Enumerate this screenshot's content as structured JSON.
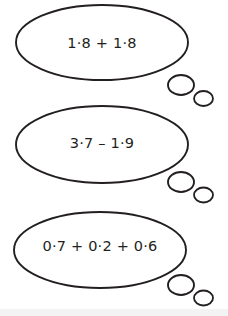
{
  "page": {
    "background_color": "#ffffff",
    "ink_color": "#231f20",
    "bottom_band_color": "#f3f3f4"
  },
  "bubbles": [
    {
      "id": "bubble-1",
      "expression": "1·8 + 1·8",
      "operation": "addition",
      "operands": [
        "1.8",
        "1.8"
      ],
      "ellipse": {
        "cx": 102,
        "cy": 42.5,
        "rx": 86,
        "ry": 37.5
      },
      "tails": [
        {
          "cx": 181,
          "cy": 85,
          "rx": 13,
          "ry": 10
        },
        {
          "cx": 203.5,
          "cy": 98.5,
          "rx": 9.5,
          "ry": 7.5
        }
      ],
      "text_position": {
        "x": 102,
        "y": 43
      }
    },
    {
      "id": "bubble-2",
      "expression": "3·7 – 1·9",
      "operation": "subtraction",
      "operands": [
        "3.7",
        "1.9"
      ],
      "ellipse": {
        "cx": 102,
        "cy": 144.5,
        "rx": 86,
        "ry": 38.5
      },
      "tails": [
        {
          "cx": 181,
          "cy": 182,
          "rx": 13,
          "ry": 10
        },
        {
          "cx": 203.5,
          "cy": 195,
          "rx": 9.5,
          "ry": 7.5
        }
      ],
      "text_position": {
        "x": 102,
        "y": 143
      }
    },
    {
      "id": "bubble-3",
      "expression": "0·7 + 0·2 + 0·6",
      "operation": "addition",
      "operands": [
        "0.7",
        "0.2",
        "0.6"
      ],
      "ellipse": {
        "cx": 100,
        "cy": 250,
        "rx": 86,
        "ry": 38
      },
      "tails": [
        {
          "cx": 181,
          "cy": 285,
          "rx": 13,
          "ry": 10
        },
        {
          "cx": 203.5,
          "cy": 298,
          "rx": 9.5,
          "ry": 7.5
        }
      ],
      "text_position": {
        "x": 100,
        "y": 246
      }
    }
  ]
}
